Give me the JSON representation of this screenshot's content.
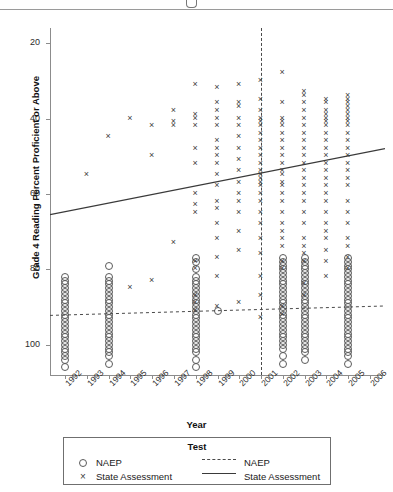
{
  "chart_data": {
    "type": "scatter",
    "title": "",
    "xlabel": "Year",
    "ylabel": "Grade 4 Reading Percent Proficient or Above",
    "xlim": [
      1991.3,
      2006.7
    ],
    "ylim": [
      12,
      104
    ],
    "yticks": [
      20,
      40,
      60,
      80,
      100
    ],
    "xticks": [
      1992,
      1993,
      1994,
      1995,
      1996,
      1997,
      1998,
      1999,
      2000,
      2001,
      2002,
      2003,
      2004,
      2005,
      2006
    ],
    "grid": false,
    "legend": {
      "title": "Test",
      "position": "below-plot",
      "entries": [
        {
          "label": "NAEP",
          "marker": "circle",
          "line": "dashed"
        },
        {
          "label": "State Assessment",
          "marker": "x",
          "line": "solid"
        }
      ]
    },
    "annotations": [
      {
        "type": "vline",
        "x": 2001,
        "style": "dashed",
        "label": ""
      }
    ],
    "trendlines": [
      {
        "name": "NAEP",
        "style": "dashed",
        "x": [
          1991.3,
          2006.7
        ],
        "y": [
          27.8,
          30.3
        ]
      },
      {
        "name": "State Assessment",
        "style": "solid",
        "x": [
          1991.3,
          2006.7
        ],
        "y": [
          54.5,
          72.0
        ]
      }
    ],
    "series": [
      {
        "name": "NAEP",
        "marker": "circle",
        "points": [
          {
            "x": 1992,
            "y": [
              14,
              16,
              17,
              18,
              19,
              20,
              21,
              22,
              23,
              24,
              25,
              26,
              27,
              28,
              29,
              30,
              31,
              32,
              33,
              34,
              35,
              36,
              37,
              38
            ]
          },
          {
            "x": 1994,
            "y": [
              15,
              17,
              18,
              19,
              20,
              21,
              22,
              23,
              24,
              25,
              26,
              27,
              28,
              29,
              30,
              31,
              32,
              33,
              34,
              35,
              36,
              37,
              38,
              41
            ]
          },
          {
            "x": 1998,
            "y": [
              14,
              16,
              18,
              19,
              20,
              21,
              22,
              23,
              24,
              25,
              26,
              27,
              28,
              29,
              30,
              31,
              32,
              33,
              34,
              35,
              36,
              37,
              38,
              40,
              42,
              43
            ]
          },
          {
            "x": 1999,
            "y": [
              29
            ]
          },
          {
            "x": 2002,
            "y": [
              15,
              17,
              19,
              20,
              21,
              22,
              23,
              24,
              25,
              26,
              27,
              28,
              29,
              30,
              31,
              32,
              33,
              34,
              35,
              36,
              37,
              38,
              39,
              40,
              41,
              42,
              43
            ]
          },
          {
            "x": 2003,
            "y": [
              16,
              18,
              19,
              20,
              21,
              22,
              23,
              24,
              25,
              26,
              27,
              28,
              29,
              30,
              31,
              32,
              33,
              34,
              35,
              36,
              37,
              38,
              39,
              40,
              41,
              42,
              43
            ]
          },
          {
            "x": 2005,
            "y": [
              15,
              17,
              18,
              19,
              20,
              21,
              22,
              23,
              24,
              25,
              26,
              27,
              28,
              29,
              30,
              31,
              32,
              33,
              34,
              35,
              36,
              37,
              38,
              39,
              40,
              41,
              42,
              43
            ]
          }
        ]
      },
      {
        "name": "State Assessment",
        "marker": "x",
        "points": [
          {
            "x": 1993,
            "y": [
              65
            ]
          },
          {
            "x": 1994,
            "y": [
              75
            ]
          },
          {
            "x": 1995,
            "y": [
              35,
              80
            ]
          },
          {
            "x": 1996,
            "y": [
              37,
              70,
              78
            ]
          },
          {
            "x": 1997,
            "y": [
              47,
              78,
              79,
              82
            ]
          },
          {
            "x": 1998,
            "y": [
              29,
              31,
              33,
              40,
              42,
              55,
              57,
              60,
              68,
              72,
              78,
              80,
              81,
              89
            ]
          },
          {
            "x": 1999,
            "y": [
              30,
              38,
              43,
              48,
              52,
              56,
              58,
              62,
              65,
              68,
              70,
              72,
              74,
              78,
              80,
              82,
              84,
              88
            ]
          },
          {
            "x": 2000,
            "y": [
              31,
              45,
              50,
              55,
              58,
              60,
              63,
              66,
              69,
              72,
              75,
              78,
              80,
              83,
              84,
              89
            ]
          },
          {
            "x": 2001,
            "y": [
              27,
              33,
              38,
              44,
              48,
              52,
              55,
              58,
              60,
              62,
              63,
              64,
              65,
              66,
              68,
              70,
              72,
              74,
              76,
              78,
              79,
              80,
              82,
              85,
              90
            ]
          },
          {
            "x": 2002,
            "y": [
              28,
              30,
              40,
              42,
              46,
              48,
              50,
              52,
              55,
              58,
              60,
              62,
              63,
              65,
              66,
              68,
              70,
              72,
              74,
              76,
              78,
              79,
              80,
              84,
              92
            ]
          },
          {
            "x": 2003,
            "y": [
              33,
              36,
              42,
              44,
              46,
              48,
              52,
              55,
              58,
              60,
              62,
              64,
              66,
              68,
              70,
              72,
              74,
              76,
              78,
              80,
              82,
              84,
              86,
              87
            ]
          },
          {
            "x": 2004,
            "y": [
              38,
              42,
              45,
              48,
              50,
              52,
              55,
              58,
              60,
              62,
              64,
              66,
              68,
              70,
              72,
              74,
              76,
              78,
              79,
              80,
              81,
              82,
              84,
              85
            ]
          },
          {
            "x": 2005,
            "y": [
              40,
              43,
              46,
              48,
              52,
              55,
              58,
              62,
              64,
              66,
              68,
              70,
              72,
              74,
              76,
              78,
              79,
              80,
              81,
              82,
              83,
              84,
              85,
              86
            ]
          }
        ]
      }
    ]
  },
  "axis": {
    "y_title": "Grade 4 Reading Percent Proficient or Above",
    "x_title": "Year",
    "y_tick_labels": [
      "100",
      "80",
      "60",
      "40",
      "20"
    ],
    "x_tick_labels": [
      "1992",
      "1993",
      "1994",
      "1995",
      "1996",
      "1997",
      "1998",
      "1999",
      "2000",
      "2001",
      "2002",
      "2003",
      "2004",
      "2005",
      "2006"
    ]
  },
  "legend": {
    "title": "Test",
    "rows": [
      {
        "marker_label": "NAEP",
        "line_label": "NAEP"
      },
      {
        "marker_label": "State Assessment",
        "line_label": "State Assessment"
      }
    ]
  },
  "colors": {
    "axis": "#8c8c8c",
    "marker_circle": "#5a5a5a",
    "marker_x": "#3d3d3d",
    "trend_solid": "#3a3a3a",
    "trend_dashed": "#4a4a4a",
    "legend_border": "#6f6f6f"
  }
}
